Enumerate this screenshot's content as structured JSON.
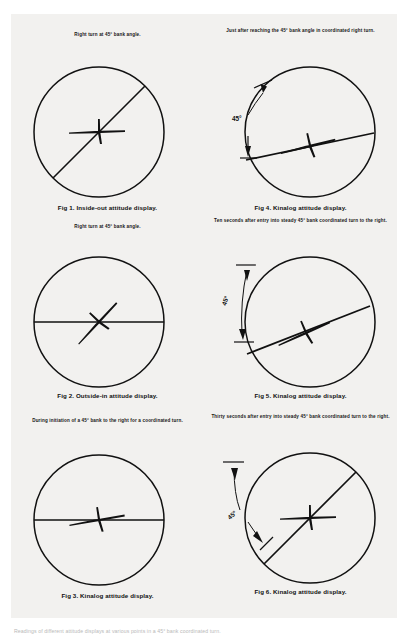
{
  "page": {
    "background_color": "#f2f1ef",
    "ink_color": "#101010",
    "bottom_note": "Readings of different attitude displays at various points in a 45° bank coordinated turn."
  },
  "figures": [
    {
      "id": "fig1",
      "position": "top-left",
      "header": "Right turn at 45° bank angle.",
      "caption": "Fig 1.  Inside-out attitude display.",
      "display_type": "inside-out",
      "horizon_line_angle_deg": 45,
      "aircraft_symbol_angle_deg": 0,
      "bank_angle_deg": 45,
      "angle_annotation": null
    },
    {
      "id": "fig4",
      "position": "top-right",
      "header": "Just after reaching the 45° bank angle in coordinated right turn.",
      "caption": "Fig 4.  Kinalog attitude display.",
      "display_type": "kinalog",
      "horizon_line_angle_deg": 12,
      "aircraft_symbol_angle_deg": 12,
      "bank_angle_deg": 45,
      "angle_annotation": {
        "label": "45°",
        "style": "slant-up-and-down"
      }
    },
    {
      "id": "fig2",
      "position": "middle-left",
      "header": "Right turn at 45° bank angle.",
      "caption": "Fig 2.  Outside-in attitude display.",
      "display_type": "outside-in",
      "horizon_line_angle_deg": 0,
      "aircraft_symbol_angle_deg": 45,
      "bank_angle_deg": 45,
      "angle_annotation": null
    },
    {
      "id": "fig5",
      "position": "middle-right",
      "header": "Ten seconds after entry into steady 45° bank coordinated turn to the right.",
      "caption": "Fig 5.  Kinalog attitude display.",
      "display_type": "kinalog",
      "horizon_line_angle_deg": 22,
      "aircraft_symbol_angle_deg": 22,
      "bank_angle_deg": 45,
      "angle_annotation": {
        "label": "45°",
        "style": "vertical-double-arrow"
      }
    },
    {
      "id": "fig3",
      "position": "bottom-left",
      "header": "During initiation of a 45° bank to the right for a coordinated turn.",
      "caption": "Fig 3.  Kinalog attitude display.",
      "display_type": "kinalog",
      "horizon_line_angle_deg": 0,
      "aircraft_symbol_angle_deg": 8,
      "bank_angle_deg": 45,
      "angle_annotation": null
    },
    {
      "id": "fig6",
      "position": "bottom-right",
      "header": "Thirty seconds after entry into steady 45° bank coordinated turn to the right.",
      "caption": "Fig 6.  Kinalog attitude display.",
      "display_type": "kinalog",
      "horizon_line_angle_deg": 45,
      "aircraft_symbol_angle_deg": 0,
      "bank_angle_deg": 45,
      "angle_annotation": {
        "label": "45°",
        "style": "up-and-slant-down"
      }
    }
  ]
}
